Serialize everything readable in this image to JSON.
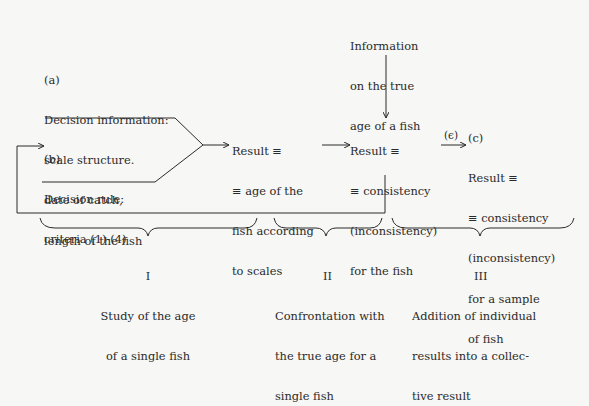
{
  "blocks": {
    "a": {
      "label": "(a)",
      "lines": [
        "Decision information:",
        "scale structure.",
        "date of catch,",
        "length of the fish"
      ]
    },
    "b": {
      "label": "(b)",
      "lines": [
        "Decision rule:",
        "criteria (1)-(4)"
      ]
    },
    "result_age": {
      "lines": [
        "Result ≡",
        "≡ age of the",
        "fish according",
        "to scales"
      ]
    },
    "true_age_info": {
      "lines": [
        "Information",
        "on the true",
        "age of a fish"
      ]
    },
    "result_consistency": {
      "lines": [
        "Result ≡",
        "≡ consistency",
        "(inconsistency)",
        "for the fish"
      ]
    },
    "epsilon_label": "(ϵ)",
    "c": {
      "label": "(c)",
      "lines": [
        "Result ≡",
        "≡ consistency",
        "(inconsistency)",
        "for a sample",
        "of fish"
      ]
    }
  },
  "stages": [
    {
      "numeral": "I",
      "lines": [
        "Study of the age",
        "of a single fish"
      ]
    },
    {
      "numeral": "II",
      "lines": [
        "Confrontation with",
        "the true age for a",
        "single fish"
      ]
    },
    {
      "numeral": "III",
      "lines": [
        "Addition of individual",
        "results into a collec-",
        "tive result"
      ]
    }
  ]
}
